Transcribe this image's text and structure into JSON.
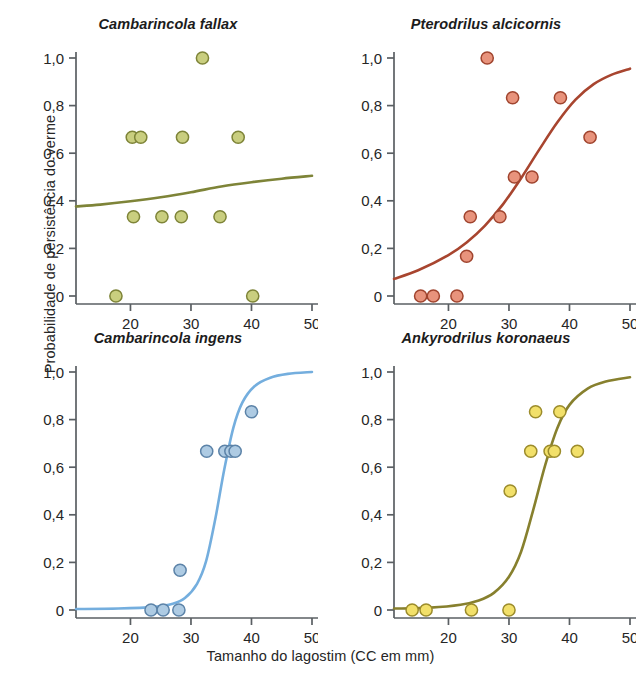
{
  "figure": {
    "xlabel": "Tamanho do lagostim (CC em mm)",
    "ylabel": "Probabilidade de persistência do verme",
    "background": "#ffffff"
  },
  "axis": {
    "x_ticks": [
      "20",
      "30",
      "40",
      "50"
    ],
    "x_tick_values": [
      20,
      30,
      40,
      50
    ],
    "y_ticks": [
      "0",
      "0,2",
      "0,4",
      "0,6",
      "0,8",
      "1,0"
    ],
    "y_tick_values": [
      0,
      0.2,
      0.4,
      0.6,
      0.8,
      1.0
    ],
    "xlim": [
      11,
      50
    ],
    "ylim": [
      0,
      1.0
    ]
  },
  "chart_data": {
    "type": "scatter",
    "xlabel": "Tamanho do lagostim (CC em mm)",
    "ylabel": "Probabilidade de persistência do verme",
    "xlim": [
      11,
      50
    ],
    "ylim": [
      0,
      1.0
    ],
    "grid": false,
    "legend": "none",
    "panel_layout": "2x2",
    "panels": [
      {
        "id": "cambarincola-fallax",
        "title": "Cambarincola fallax",
        "marker_fill": "#c9ce7f",
        "marker_edge": "#7e8438",
        "line_color": "#7e8438",
        "points": [
          {
            "x": 17.6,
            "y": 0.0
          },
          {
            "x": 20.3,
            "y": 0.667
          },
          {
            "x": 21.7,
            "y": 0.667
          },
          {
            "x": 20.5,
            "y": 0.333
          },
          {
            "x": 25.2,
            "y": 0.333
          },
          {
            "x": 28.4,
            "y": 0.333
          },
          {
            "x": 28.6,
            "y": 0.667
          },
          {
            "x": 31.9,
            "y": 1.0
          },
          {
            "x": 34.8,
            "y": 0.333
          },
          {
            "x": 37.8,
            "y": 0.667
          },
          {
            "x": 40.2,
            "y": 0.0
          }
        ],
        "fit_curve": [
          {
            "x": 11.0,
            "y": 0.376
          },
          {
            "x": 15.0,
            "y": 0.384
          },
          {
            "x": 20.0,
            "y": 0.398
          },
          {
            "x": 25.0,
            "y": 0.415
          },
          {
            "x": 30.0,
            "y": 0.436
          },
          {
            "x": 35.0,
            "y": 0.46
          },
          {
            "x": 40.0,
            "y": 0.478
          },
          {
            "x": 45.0,
            "y": 0.493
          },
          {
            "x": 50.0,
            "y": 0.505
          }
        ]
      },
      {
        "id": "pterodrilus-alcicornis",
        "title": "Pterodrilus alcicornis",
        "marker_fill": "#e8937c",
        "marker_edge": "#a0442e",
        "line_color": "#a8452f",
        "points": [
          {
            "x": 15.4,
            "y": 0.0
          },
          {
            "x": 17.5,
            "y": 0.0
          },
          {
            "x": 21.4,
            "y": 0.0
          },
          {
            "x": 23.0,
            "y": 0.167
          },
          {
            "x": 23.6,
            "y": 0.333
          },
          {
            "x": 26.4,
            "y": 1.0
          },
          {
            "x": 28.5,
            "y": 0.333
          },
          {
            "x": 30.6,
            "y": 0.833
          },
          {
            "x": 30.9,
            "y": 0.5
          },
          {
            "x": 33.8,
            "y": 0.5
          },
          {
            "x": 38.5,
            "y": 0.833
          },
          {
            "x": 43.4,
            "y": 0.667
          }
        ],
        "fit_curve": [
          {
            "x": 11.0,
            "y": 0.072
          },
          {
            "x": 15.0,
            "y": 0.108
          },
          {
            "x": 20.0,
            "y": 0.172
          },
          {
            "x": 23.0,
            "y": 0.225
          },
          {
            "x": 26.0,
            "y": 0.295
          },
          {
            "x": 29.0,
            "y": 0.385
          },
          {
            "x": 32.0,
            "y": 0.495
          },
          {
            "x": 35.0,
            "y": 0.615
          },
          {
            "x": 38.0,
            "y": 0.73
          },
          {
            "x": 41.0,
            "y": 0.825
          },
          {
            "x": 44.0,
            "y": 0.89
          },
          {
            "x": 47.0,
            "y": 0.93
          },
          {
            "x": 50.0,
            "y": 0.955
          }
        ]
      },
      {
        "id": "cambarincola-ingens",
        "title": "Cambarincola ingens",
        "marker_fill": "#aecbe3",
        "marker_edge": "#5c83a8",
        "line_color": "#74aede",
        "points": [
          {
            "x": 23.4,
            "y": 0.0
          },
          {
            "x": 25.4,
            "y": 0.0
          },
          {
            "x": 28.0,
            "y": 0.0
          },
          {
            "x": 28.2,
            "y": 0.167
          },
          {
            "x": 32.6,
            "y": 0.667
          },
          {
            "x": 35.6,
            "y": 0.667
          },
          {
            "x": 36.6,
            "y": 0.667
          },
          {
            "x": 37.3,
            "y": 0.667
          },
          {
            "x": 40.0,
            "y": 0.833
          }
        ],
        "fit_curve": [
          {
            "x": 11.0,
            "y": 0.004
          },
          {
            "x": 18.0,
            "y": 0.006
          },
          {
            "x": 24.0,
            "y": 0.013
          },
          {
            "x": 27.0,
            "y": 0.026
          },
          {
            "x": 29.0,
            "y": 0.05
          },
          {
            "x": 31.0,
            "y": 0.11
          },
          {
            "x": 32.5,
            "y": 0.205
          },
          {
            "x": 34.0,
            "y": 0.38
          },
          {
            "x": 35.5,
            "y": 0.59
          },
          {
            "x": 37.0,
            "y": 0.765
          },
          {
            "x": 38.5,
            "y": 0.872
          },
          {
            "x": 40.5,
            "y": 0.94
          },
          {
            "x": 43.0,
            "y": 0.975
          },
          {
            "x": 46.0,
            "y": 0.992
          },
          {
            "x": 50.0,
            "y": 1.0
          }
        ]
      },
      {
        "id": "ankyrodrilus-koronaeus",
        "title": "Ankyrodrilus koronaeus",
        "marker_fill": "#f2e06a",
        "marker_edge": "#9c8c2b",
        "line_color": "#87802e",
        "points": [
          {
            "x": 14.0,
            "y": 0.0
          },
          {
            "x": 16.3,
            "y": 0.0
          },
          {
            "x": 23.8,
            "y": 0.0
          },
          {
            "x": 30.0,
            "y": 0.0
          },
          {
            "x": 30.2,
            "y": 0.5
          },
          {
            "x": 33.6,
            "y": 0.667
          },
          {
            "x": 34.4,
            "y": 0.833
          },
          {
            "x": 36.8,
            "y": 0.667
          },
          {
            "x": 37.5,
            "y": 0.667
          },
          {
            "x": 38.4,
            "y": 0.833
          },
          {
            "x": 41.3,
            "y": 0.667
          }
        ],
        "fit_curve": [
          {
            "x": 11.0,
            "y": 0.006
          },
          {
            "x": 17.0,
            "y": 0.01
          },
          {
            "x": 22.0,
            "y": 0.022
          },
          {
            "x": 25.0,
            "y": 0.04
          },
          {
            "x": 27.5,
            "y": 0.072
          },
          {
            "x": 30.0,
            "y": 0.14
          },
          {
            "x": 32.0,
            "y": 0.245
          },
          {
            "x": 34.0,
            "y": 0.42
          },
          {
            "x": 36.0,
            "y": 0.61
          },
          {
            "x": 38.0,
            "y": 0.765
          },
          {
            "x": 40.0,
            "y": 0.862
          },
          {
            "x": 43.0,
            "y": 0.93
          },
          {
            "x": 46.0,
            "y": 0.96
          },
          {
            "x": 50.0,
            "y": 0.978
          }
        ]
      }
    ]
  }
}
